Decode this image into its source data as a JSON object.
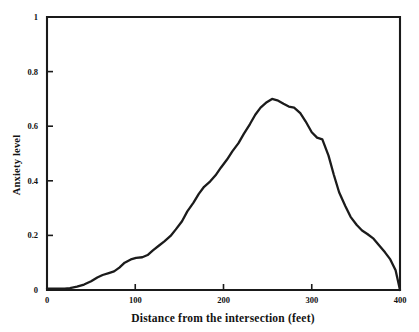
{
  "chart_data": {
    "type": "line",
    "title": "",
    "xlabel": "Distance from the intersection (feet)",
    "ylabel": "Anxiety level",
    "xlim": [
      0,
      400
    ],
    "ylim": [
      0,
      1
    ],
    "grid": false,
    "legend": null,
    "xticks": [
      0,
      100,
      200,
      300,
      400
    ],
    "xtick_labels": [
      "0",
      "100",
      "200",
      "300",
      "400"
    ],
    "yticks": [
      0,
      0.2,
      0.4,
      0.6,
      0.8,
      1
    ],
    "ytick_labels": [
      "0",
      "0.2",
      "0.4",
      "0.6",
      "0.8",
      "1"
    ],
    "series": [
      {
        "name": "Anxiety level",
        "color": "#1b1b1b",
        "x": [
          0,
          10,
          20,
          26,
          34,
          42,
          50,
          57,
          63,
          70,
          76,
          82,
          88,
          95,
          101,
          108,
          114,
          120,
          127,
          133,
          140,
          146,
          153,
          159,
          166,
          172,
          178,
          185,
          191,
          197,
          204,
          210,
          217,
          223,
          230,
          236,
          242,
          249,
          255,
          261,
          268,
          274,
          280,
          287,
          293,
          300,
          306,
          312,
          319,
          325,
          331,
          338,
          344,
          351,
          357,
          363,
          370,
          376,
          383,
          389,
          395,
          400
        ],
        "y": [
          0.005,
          0.005,
          0.005,
          0.007,
          0.012,
          0.02,
          0.032,
          0.046,
          0.055,
          0.062,
          0.068,
          0.082,
          0.1,
          0.112,
          0.118,
          0.12,
          0.128,
          0.145,
          0.163,
          0.178,
          0.198,
          0.222,
          0.252,
          0.288,
          0.32,
          0.352,
          0.378,
          0.398,
          0.42,
          0.448,
          0.478,
          0.508,
          0.538,
          0.572,
          0.608,
          0.642,
          0.668,
          0.688,
          0.7,
          0.695,
          0.682,
          0.672,
          0.668,
          0.648,
          0.618,
          0.578,
          0.558,
          0.552,
          0.492,
          0.422,
          0.358,
          0.308,
          0.268,
          0.238,
          0.218,
          0.205,
          0.188,
          0.165,
          0.138,
          0.112,
          0.072,
          0.0
        ]
      }
    ]
  },
  "axes": {
    "x_title": "Distance from the intersection (feet)",
    "y_title": "Anxiety level"
  }
}
